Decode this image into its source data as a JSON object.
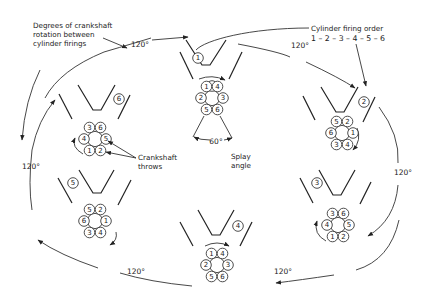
{
  "labels": {
    "degrees_note_line1": "Degrees of crankshaft",
    "degrees_note_line2": "rotation between",
    "degrees_note_line3": "cylinder firings",
    "firing_order_title": "Cylinder firing order",
    "firing_order_value": "1 – 2 – 3 – 4 – 5 – 6",
    "crankshaft_throws_line1": "Crankshaft",
    "crankshaft_throws_line2": "throws",
    "splay_line1": "Splay",
    "splay_line2": "angle",
    "splay_angle": "60°"
  },
  "rotation_labels": {
    "top_left": "120°",
    "top_right": "120°",
    "right": "120°",
    "bottom_right": "120°",
    "bottom_left": "120°",
    "left": "120°"
  },
  "stages": [
    {
      "firing_cylinder": "1",
      "throws": [
        "1",
        "4",
        "3",
        "6",
        "5",
        "2"
      ]
    },
    {
      "firing_cylinder": "2",
      "throws": [
        "5",
        "2",
        "1",
        "4",
        "3",
        "6"
      ]
    },
    {
      "firing_cylinder": "3",
      "throws": [
        "3",
        "6",
        "5",
        "2",
        "1",
        "4"
      ]
    },
    {
      "firing_cylinder": "4",
      "throws": [
        "1",
        "4",
        "3",
        "6",
        "5",
        "2"
      ]
    },
    {
      "firing_cylinder": "5",
      "throws": [
        "5",
        "2",
        "1",
        "4",
        "3",
        "6"
      ]
    },
    {
      "firing_cylinder": "6",
      "throws": [
        "3",
        "6",
        "5",
        "2",
        "1",
        "4"
      ]
    }
  ]
}
